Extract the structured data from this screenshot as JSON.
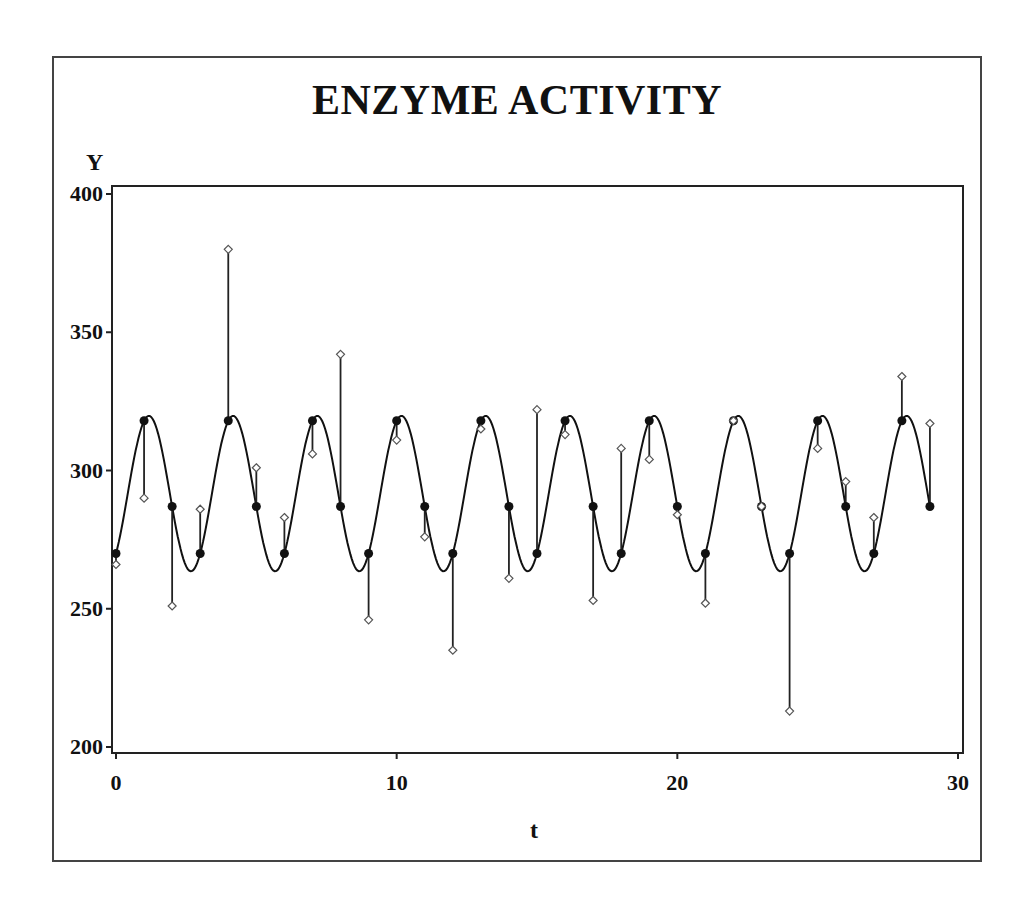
{
  "chart_data": {
    "type": "line",
    "title": "ENZYME ACTIVITY",
    "xlabel": "t",
    "ylabel": "Y",
    "xlim": [
      0,
      30
    ],
    "ylim": [
      200,
      400
    ],
    "xticks": [
      0,
      10,
      20,
      30
    ],
    "yticks": [
      200,
      250,
      300,
      350,
      400
    ],
    "grid": false,
    "legend": null,
    "x": [
      0,
      1,
      2,
      3,
      4,
      5,
      6,
      7,
      8,
      9,
      10,
      11,
      12,
      13,
      14,
      15,
      16,
      17,
      18,
      19,
      20,
      21,
      22,
      23,
      24,
      25,
      26,
      27,
      28,
      29
    ],
    "series": [
      {
        "name": "Observed",
        "marker": "open-diamond",
        "values": [
          266,
          290,
          251,
          286,
          380,
          301,
          283,
          306,
          342,
          246,
          311,
          276,
          235,
          315,
          261,
          322,
          313,
          253,
          308,
          304,
          284,
          252,
          318,
          287,
          213,
          308,
          296,
          283,
          334,
          317
        ]
      },
      {
        "name": "Fitted",
        "marker": "filled-circle",
        "style": "smooth periodic curve (period 3)",
        "values": [
          270,
          318,
          287,
          270,
          318,
          287,
          270,
          318,
          287,
          270,
          318,
          287,
          270,
          318,
          287,
          270,
          318,
          287,
          270,
          318,
          287,
          270,
          318,
          287,
          270,
          318,
          287,
          270,
          318,
          287
        ]
      }
    ],
    "annotations": "Vertical residual lines connect each observed value to its fitted value"
  },
  "colors": {
    "line": "#111111",
    "frame": "#444444",
    "marker_open": "#ffffff"
  }
}
